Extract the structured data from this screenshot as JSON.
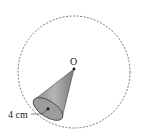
{
  "diagram": {
    "apex_label": "O",
    "radius_label": "4 cm",
    "colors": {
      "circle": "#555555",
      "cone_fill": "#a8a8a8",
      "cone_dark": "#7a7a7a",
      "base_fill": "#9a9a9a",
      "point": "#111111"
    }
  }
}
